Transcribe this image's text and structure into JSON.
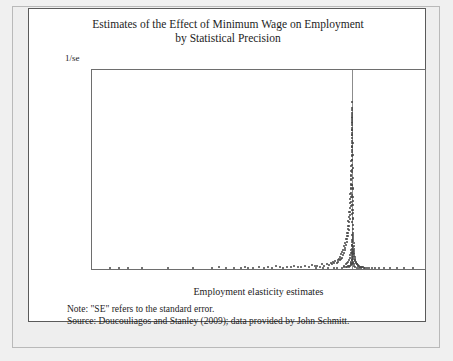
{
  "figure": {
    "title_line1": "Estimates of the Effect of Minimum Wage on Employment",
    "title_line2": "by Statistical Precision",
    "note": "Note:  \"SE\" refers to the standard error.",
    "source": "Source: Doucouliagos and Stanley (2009); data provided by John Schmitt."
  },
  "chart_data": {
    "type": "scatter",
    "title": "Estimates of the Effect of Minimum Wage on Employment by Statistical Precision",
    "xlabel": "Employment elasticity estimates",
    "ylabel": "1/se",
    "xlim": [
      -21.5,
      6.0
    ],
    "ylim": [
      0,
      350
    ],
    "xticks": [
      -20,
      -15,
      -10,
      -5,
      0,
      5
    ],
    "yticks": [
      0,
      50,
      100,
      150,
      200,
      250,
      300,
      350
    ],
    "grid": false,
    "legend": null,
    "reference_line_x": 0,
    "marker_color": "#444444",
    "axis_color": "#6e6e6e",
    "series": [
      {
        "name": "Minimum wage employment elasticity estimates",
        "points": [
          [
            -20.0,
            1
          ],
          [
            -19.3,
            2
          ],
          [
            -18.5,
            1
          ],
          [
            -17.4,
            2
          ],
          [
            -15.2,
            1
          ],
          [
            -13.2,
            2
          ],
          [
            -11.6,
            1
          ],
          [
            -11.0,
            3
          ],
          [
            -10.4,
            2
          ],
          [
            -9.8,
            1
          ],
          [
            -9.2,
            2
          ],
          [
            -8.9,
            3
          ],
          [
            -8.6,
            1
          ],
          [
            -8.2,
            2
          ],
          [
            -7.7,
            4
          ],
          [
            -7.3,
            2
          ],
          [
            -7.0,
            3
          ],
          [
            -6.6,
            2
          ],
          [
            -6.3,
            5
          ],
          [
            -6.0,
            3
          ],
          [
            -5.7,
            2
          ],
          [
            -5.4,
            4
          ],
          [
            -5.1,
            3
          ],
          [
            -4.8,
            6
          ],
          [
            -4.5,
            4
          ],
          [
            -4.2,
            3
          ],
          [
            -3.9,
            5
          ],
          [
            -3.6,
            4
          ],
          [
            -3.3,
            7
          ],
          [
            -3.1,
            5
          ],
          [
            -2.9,
            6
          ],
          [
            -2.7,
            4
          ],
          [
            -2.5,
            8
          ],
          [
            -2.3,
            6
          ],
          [
            -2.1,
            9
          ],
          [
            -1.95,
            7
          ],
          [
            -1.8,
            11
          ],
          [
            -1.7,
            8
          ],
          [
            -1.6,
            12
          ],
          [
            -1.5,
            10
          ],
          [
            -1.4,
            14
          ],
          [
            -1.3,
            11
          ],
          [
            -1.2,
            16
          ],
          [
            -1.15,
            13
          ],
          [
            -1.1,
            18
          ],
          [
            -1.05,
            15
          ],
          [
            -1.0,
            22
          ],
          [
            -0.95,
            17
          ],
          [
            -0.9,
            26
          ],
          [
            -0.86,
            20
          ],
          [
            -0.82,
            30
          ],
          [
            -0.78,
            24
          ],
          [
            -0.74,
            34
          ],
          [
            -0.7,
            28
          ],
          [
            -0.66,
            40
          ],
          [
            -0.63,
            33
          ],
          [
            -0.6,
            46
          ],
          [
            -0.57,
            37
          ],
          [
            -0.54,
            52
          ],
          [
            -0.51,
            42
          ],
          [
            -0.48,
            58
          ],
          [
            -0.46,
            47
          ],
          [
            -0.44,
            64
          ],
          [
            -0.42,
            52
          ],
          [
            -0.4,
            70
          ],
          [
            -0.38,
            58
          ],
          [
            -0.36,
            76
          ],
          [
            -0.34,
            63
          ],
          [
            -0.32,
            84
          ],
          [
            -0.3,
            69
          ],
          [
            -0.285,
            92
          ],
          [
            -0.27,
            75
          ],
          [
            -0.255,
            100
          ],
          [
            -0.24,
            82
          ],
          [
            -0.225,
            108
          ],
          [
            -0.21,
            88
          ],
          [
            -0.2,
            116
          ],
          [
            -0.19,
            95
          ],
          [
            -0.18,
            124
          ],
          [
            -0.17,
            101
          ],
          [
            -0.16,
            132
          ],
          [
            -0.15,
            110
          ],
          [
            -0.14,
            140
          ],
          [
            -0.13,
            118
          ],
          [
            -0.125,
            148
          ],
          [
            -0.12,
            126
          ],
          [
            -0.115,
            156
          ],
          [
            -0.11,
            134
          ],
          [
            -0.105,
            164
          ],
          [
            -0.1,
            142
          ],
          [
            -0.095,
            172
          ],
          [
            -0.09,
            150
          ],
          [
            -0.085,
            181
          ],
          [
            -0.08,
            158
          ],
          [
            -0.075,
            190
          ],
          [
            -0.07,
            166
          ],
          [
            -0.065,
            198
          ],
          [
            -0.06,
            175
          ],
          [
            -0.058,
            206
          ],
          [
            -0.055,
            183
          ],
          [
            -0.052,
            214
          ],
          [
            -0.05,
            192
          ],
          [
            -0.047,
            222
          ],
          [
            -0.045,
            200
          ],
          [
            -0.042,
            231
          ],
          [
            -0.04,
            209
          ],
          [
            -0.037,
            240
          ],
          [
            -0.035,
            217
          ],
          [
            -0.032,
            248
          ],
          [
            -0.03,
            226
          ],
          [
            -0.028,
            257
          ],
          [
            -0.025,
            235
          ],
          [
            -0.022,
            266
          ],
          [
            -0.02,
            244
          ],
          [
            -0.018,
            275
          ],
          [
            -0.015,
            253
          ],
          [
            -0.012,
            284
          ],
          [
            -0.01,
            262
          ],
          [
            -0.008,
            294
          ],
          [
            -0.005,
            271
          ],
          [
            0.0,
            280
          ],
          [
            0.0,
            258
          ],
          [
            0.0,
            236
          ],
          [
            0.0,
            214
          ],
          [
            0.0,
            192
          ],
          [
            0.0,
            170
          ],
          [
            0.0,
            148
          ],
          [
            0.0,
            126
          ],
          [
            0.0,
            104
          ],
          [
            0.0,
            82
          ],
          [
            0.0,
            60
          ],
          [
            0.0,
            42
          ],
          [
            0.0,
            28
          ],
          [
            0.0,
            16
          ],
          [
            0.0,
            8
          ],
          [
            0.005,
            268
          ],
          [
            0.01,
            245
          ],
          [
            0.015,
            222
          ],
          [
            0.02,
            200
          ],
          [
            0.025,
            178
          ],
          [
            0.03,
            160
          ],
          [
            0.035,
            142
          ],
          [
            0.04,
            126
          ],
          [
            0.045,
            112
          ],
          [
            0.05,
            99
          ],
          [
            0.055,
            88
          ],
          [
            0.06,
            78
          ],
          [
            0.065,
            70
          ],
          [
            0.07,
            63
          ],
          [
            0.08,
            56
          ],
          [
            0.09,
            50
          ],
          [
            0.1,
            45
          ],
          [
            0.11,
            40
          ],
          [
            0.12,
            36
          ],
          [
            0.13,
            32
          ],
          [
            0.14,
            29
          ],
          [
            0.15,
            26
          ],
          [
            0.17,
            23
          ],
          [
            0.19,
            21
          ],
          [
            0.21,
            18
          ],
          [
            0.23,
            16
          ],
          [
            0.26,
            14
          ],
          [
            0.29,
            12
          ],
          [
            0.32,
            11
          ],
          [
            0.36,
            9
          ],
          [
            0.4,
            8
          ],
          [
            0.45,
            7
          ],
          [
            0.5,
            6
          ],
          [
            0.56,
            5
          ],
          [
            0.63,
            4
          ],
          [
            0.7,
            4
          ],
          [
            0.8,
            3
          ],
          [
            0.9,
            3
          ],
          [
            1.05,
            2
          ],
          [
            1.2,
            2
          ],
          [
            1.4,
            2
          ],
          [
            1.6,
            1
          ],
          [
            1.9,
            1
          ],
          [
            2.2,
            1
          ],
          [
            2.6,
            1
          ],
          [
            3.1,
            1
          ],
          [
            3.7,
            1
          ],
          [
            4.3,
            1
          ],
          [
            5.0,
            2
          ],
          [
            -0.3,
            4
          ],
          [
            -0.25,
            5
          ],
          [
            -0.2,
            6
          ],
          [
            -0.15,
            7
          ],
          [
            -0.12,
            9
          ],
          [
            -0.1,
            11
          ],
          [
            -0.08,
            13
          ],
          [
            -0.06,
            15
          ],
          [
            -0.05,
            18
          ],
          [
            -0.04,
            21
          ],
          [
            -0.03,
            25
          ],
          [
            -0.02,
            30
          ],
          [
            -0.015,
            36
          ],
          [
            -0.01,
            43
          ],
          [
            -0.005,
            51
          ],
          [
            0.005,
            48
          ],
          [
            0.01,
            40
          ],
          [
            0.02,
            33
          ],
          [
            0.03,
            27
          ],
          [
            0.04,
            22
          ],
          [
            0.05,
            17
          ],
          [
            0.07,
            13
          ],
          [
            0.09,
            10
          ],
          [
            0.12,
            8
          ],
          [
            0.16,
            6
          ],
          [
            -0.55,
            3
          ],
          [
            -0.45,
            4
          ],
          [
            -0.38,
            5
          ],
          [
            -0.7,
            3
          ],
          [
            -0.85,
            2
          ],
          [
            -1.25,
            2
          ],
          [
            -1.55,
            2
          ],
          [
            -2.0,
            1
          ],
          [
            -2.4,
            1
          ],
          [
            -3.0,
            1
          ],
          [
            0.25,
            3
          ],
          [
            0.35,
            2
          ],
          [
            0.55,
            2
          ],
          [
            0.75,
            1
          ],
          [
            1.0,
            1
          ],
          [
            -0.65,
            6
          ],
          [
            -0.5,
            8
          ],
          [
            -0.42,
            10
          ],
          [
            -0.35,
            13
          ],
          [
            -0.28,
            16
          ],
          [
            -0.22,
            20
          ],
          [
            -0.17,
            24
          ],
          [
            -0.13,
            28
          ],
          [
            -0.09,
            34
          ],
          [
            0.015,
            60
          ],
          [
            0.025,
            52
          ],
          [
            0.045,
            38
          ],
          [
            0.065,
            30
          ],
          [
            -0.02,
            148
          ],
          [
            -0.03,
            130
          ],
          [
            -0.045,
            112
          ],
          [
            -0.06,
            96
          ],
          [
            0.02,
            140
          ],
          [
            0.03,
            120
          ],
          [
            0.04,
            104
          ],
          [
            0.055,
            90
          ]
        ]
      }
    ]
  }
}
